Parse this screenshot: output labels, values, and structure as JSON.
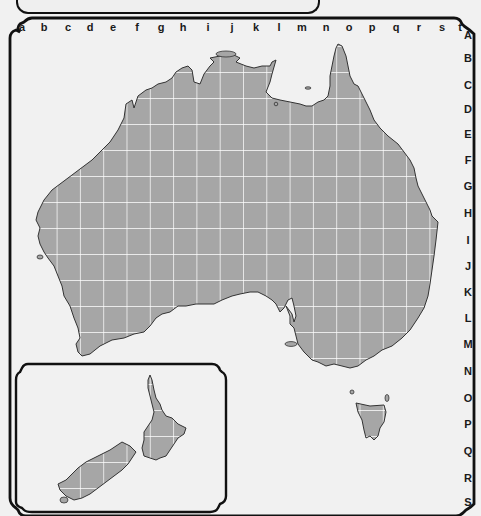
{
  "map": {
    "title": "Australia and New Zealand grid reference map",
    "column_labels": [
      "a",
      "b",
      "c",
      "d",
      "e",
      "f",
      "g",
      "h",
      "i",
      "j",
      "k",
      "l",
      "m",
      "n",
      "o",
      "p",
      "q",
      "r",
      "s",
      "t"
    ],
    "row_labels": [
      "A",
      "B",
      "C",
      "D",
      "E",
      "F",
      "G",
      "H",
      "I",
      "J",
      "K",
      "L",
      "M",
      "N",
      "O",
      "P",
      "Q",
      "R",
      "S"
    ],
    "column_x": [
      22,
      44,
      68,
      90,
      113,
      137,
      161,
      183,
      208,
      232,
      256,
      279,
      302,
      326,
      349,
      372,
      396,
      419,
      442,
      465
    ],
    "row_y": [
      34,
      58,
      84,
      109,
      134,
      160,
      186,
      212,
      240,
      266,
      292,
      318,
      344,
      370,
      398,
      424,
      450,
      478,
      502
    ],
    "regions": [
      {
        "name": "Australia",
        "type": "mainland"
      },
      {
        "name": "Tasmania",
        "type": "island"
      },
      {
        "name": "New Zealand",
        "type": "inset"
      }
    ],
    "colors": {
      "land": "#a6a6a6",
      "sea": "#f1f1f1",
      "grid": "#ffffff",
      "border": "#111111",
      "label": "#1a1a1a"
    }
  }
}
